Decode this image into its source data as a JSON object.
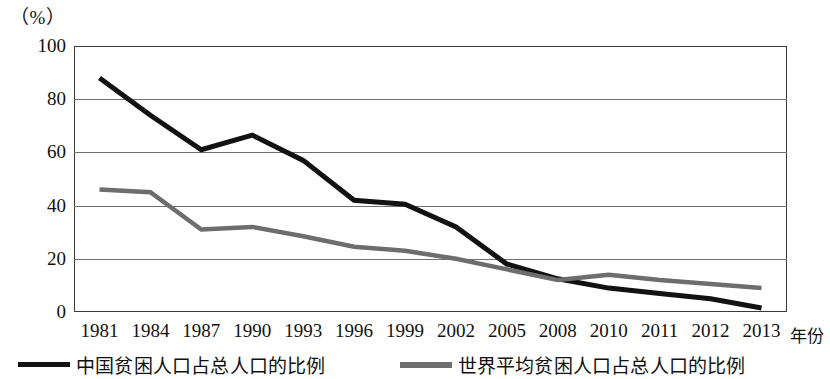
{
  "chart_data": {
    "type": "line",
    "title": "",
    "unit_label": "（%）",
    "xlabel": "年份",
    "ylabel": "",
    "categories": [
      "1981",
      "1984",
      "1987",
      "1990",
      "1993",
      "1996",
      "1999",
      "2002",
      "2005",
      "2008",
      "2010",
      "2011",
      "2012",
      "2013"
    ],
    "ylim": [
      0,
      100
    ],
    "yticks": [
      "0",
      "20",
      "40",
      "60",
      "80",
      "100"
    ],
    "ytick_values": [
      0,
      20,
      40,
      60,
      80,
      100
    ],
    "grid": true,
    "legend_position": "bottom",
    "series": [
      {
        "name": "中国贫困人口占总人口的比例",
        "color": "#121212",
        "values": [
          88,
          74,
          61,
          66.5,
          57,
          42,
          40.5,
          32,
          18,
          12.5,
          9,
          7,
          5,
          1.5
        ]
      },
      {
        "name": "世界平均贫困人口占总人口的比例",
        "color": "#6d6d6d",
        "values": [
          46,
          45,
          31,
          32,
          28.5,
          24.5,
          23,
          20,
          16,
          12,
          14,
          12,
          10.5,
          9
        ]
      }
    ]
  },
  "axis": {
    "x_title": "年份"
  }
}
